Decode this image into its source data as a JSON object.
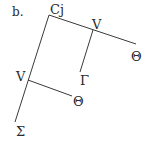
{
  "diagram": {
    "panel_label": "b.",
    "type": "syntax-tree",
    "nodes": [
      {
        "id": "cj",
        "label": "Cj"
      },
      {
        "id": "v1",
        "label": "V"
      },
      {
        "id": "theta1",
        "label": "Θ"
      },
      {
        "id": "gamma",
        "label": "Γ"
      },
      {
        "id": "v2",
        "label": "V"
      },
      {
        "id": "theta2",
        "label": "Θ"
      },
      {
        "id": "sigma",
        "label": "Σ"
      }
    ],
    "edges": [
      {
        "from": "cj",
        "to": "v1"
      },
      {
        "from": "v1",
        "to": "theta1"
      },
      {
        "from": "v1",
        "to": "gamma"
      },
      {
        "from": "cj",
        "to": "v2"
      },
      {
        "from": "v2",
        "to": "theta2"
      },
      {
        "from": "v2",
        "to": "sigma"
      }
    ]
  }
}
